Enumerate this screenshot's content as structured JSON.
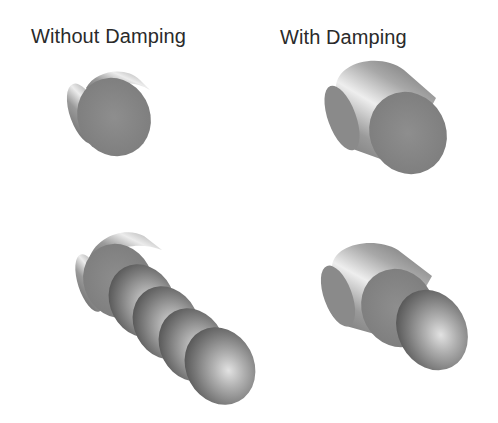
{
  "labels": {
    "left": "Without Damping",
    "right": "With Damping"
  },
  "panels": [
    {
      "id": "top-left",
      "description": "single thin disc (without damping, initial state)"
    },
    {
      "id": "top-right",
      "description": "single cylinder (with damping, initial state)"
    },
    {
      "id": "bottom-left",
      "description": "disc followed by four ellipsoidal bulges along diagonal (without damping)"
    },
    {
      "id": "bottom-right",
      "description": "cylinder with one ellipsoidal bulge (with damping)"
    }
  ],
  "colors": {
    "background": "#ffffff",
    "text": "#2a2a2a",
    "face": "#8a8a8a",
    "highlight": "#e6e6e6",
    "shadow": "#5c5c5c"
  }
}
